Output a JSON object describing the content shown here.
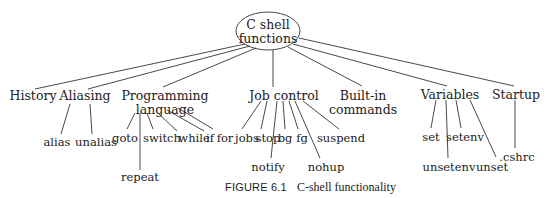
{
  "root": {
    "line1": "C shell",
    "line2": "functions"
  },
  "categories": [
    {
      "label": "History"
    },
    {
      "label": "Aliasing",
      "children": [
        "alias",
        "unalias"
      ]
    },
    {
      "label_line1": "Programming",
      "label_line2": "language",
      "children": [
        "goto",
        "repeat",
        "switch",
        "while",
        "if",
        "for"
      ]
    },
    {
      "label": "Job control",
      "children": [
        "jobs",
        "stop",
        "notify",
        "bg",
        "fg",
        "nohup",
        "suspend"
      ]
    },
    {
      "label_line1": "Built-in",
      "label_line2": "commands"
    },
    {
      "label": "Variables",
      "children": [
        "set",
        "unsetenv",
        "setenv",
        "unset"
      ]
    },
    {
      "label": "Startup",
      "children": [
        ".cshrc"
      ]
    }
  ],
  "caption": {
    "number": "FIGURE 6.1",
    "title": "C-shell functionality"
  },
  "colors": {
    "line": "#333333",
    "text": "#222222",
    "background": "#ffffff"
  }
}
